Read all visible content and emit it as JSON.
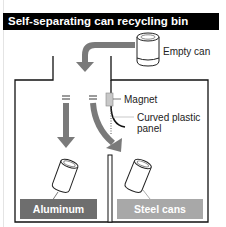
{
  "title": "Self-separating can recycling bin",
  "labels": {
    "empty_can": "Empty can",
    "magnet": "Magnet",
    "curved_panel": "Curved plastic panel",
    "aluminum": "Aluminum cans",
    "steel": "Steel cans"
  },
  "colors": {
    "title_bg": "#000000",
    "arrow": "#7a7a7a",
    "aluminum_bg": "#6e6e6e",
    "steel_bg": "#a8a8a8",
    "magnet": "#c8c8c8"
  }
}
